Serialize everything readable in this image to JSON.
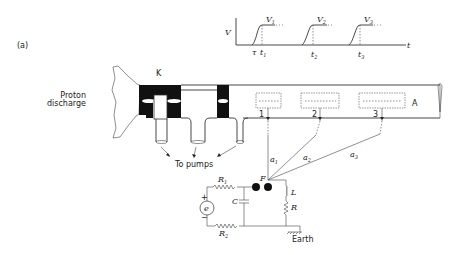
{
  "figure": {
    "panel_label": "(a)",
    "source_label": "Proton discharge",
    "source_label_lines": [
      "Proton",
      "discharge"
    ],
    "k_label": "K",
    "a_label": "A",
    "pumps_label": "To pumps",
    "probes": [
      {
        "id": "1",
        "label": "1",
        "wire_label": "a",
        "wire_sub": "1"
      },
      {
        "id": "2",
        "label": "2",
        "wire_label": "a",
        "wire_sub": "2"
      },
      {
        "id": "3",
        "label": "3",
        "wire_label": "a",
        "wire_sub": "3"
      }
    ],
    "circuit": {
      "r1": "R",
      "r1_sub": "1",
      "r2": "R",
      "r2_sub": "2",
      "capacitor": "C",
      "spark_gap": "F",
      "inductor": "L",
      "resistor": "R",
      "source": "e",
      "plus": "+",
      "minus": "−",
      "earth": "Earth"
    },
    "waveform": {
      "y_axis": "V",
      "x_axis": "t",
      "tau": "τ",
      "pulses": [
        {
          "v": "V",
          "v_sub": "1",
          "t": "t",
          "t_sub": "1"
        },
        {
          "v": "V",
          "v_sub": "2",
          "t": "t",
          "t_sub": "2"
        },
        {
          "v": "V",
          "v_sub": "3",
          "t": "t",
          "t_sub": "3"
        }
      ]
    }
  }
}
